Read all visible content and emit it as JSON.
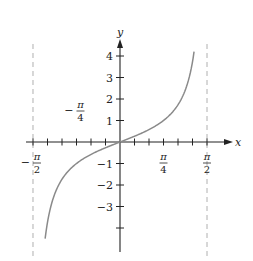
{
  "chart_data": {
    "type": "line",
    "title": "",
    "function": "y = tan(x)",
    "xlabel": "x",
    "ylabel": "y",
    "xlim": [
      -1.5708,
      1.5708
    ],
    "ylim": [
      -5,
      4.5
    ],
    "x_ticks": {
      "step": 0.2618,
      "labels": [
        {
          "value": -1.5708,
          "text": "−π/2",
          "num": "π",
          "den": "2",
          "sign": "−"
        },
        {
          "value": -0.7854,
          "text": "−π/4",
          "num": "π",
          "den": "4",
          "sign": "−"
        },
        {
          "value": 0.7854,
          "text": "π/4",
          "num": "π",
          "den": "4",
          "sign": ""
        },
        {
          "value": 1.5708,
          "text": "π/2",
          "num": "π",
          "den": "2",
          "sign": ""
        }
      ]
    },
    "y_ticks": {
      "values": [
        -4,
        -3,
        -2,
        -1,
        1,
        2,
        3,
        4
      ],
      "labels": [
        {
          "value": 4,
          "text": "4"
        },
        {
          "value": 3,
          "text": "3"
        },
        {
          "value": 2,
          "text": "2"
        },
        {
          "value": 1,
          "text": "1"
        },
        {
          "value": -1,
          "text": "−1"
        },
        {
          "value": -2,
          "text": "−2"
        },
        {
          "value": -3,
          "text": "−3"
        }
      ]
    },
    "asymptotes": [
      {
        "x": -1.5708,
        "style": "dashed"
      },
      {
        "x": 1.5708,
        "style": "dashed"
      }
    ],
    "series": [
      {
        "name": "tan(x)",
        "x_range": [
          -1.352,
          1.337
        ],
        "x": [
          -1.352,
          -1.3,
          -1.2,
          -1.1,
          -1.0,
          -0.8,
          -0.6,
          -0.4,
          -0.2,
          0,
          0.2,
          0.4,
          0.6,
          0.8,
          1.0,
          1.1,
          1.2,
          1.3,
          1.337
        ],
        "values": [
          -4.5,
          -3.6,
          -2.57,
          -1.96,
          -1.56,
          -1.03,
          -0.68,
          -0.42,
          -0.2,
          0,
          0.2,
          0.42,
          0.68,
          1.03,
          1.56,
          1.96,
          2.57,
          3.6,
          4.2
        ],
        "color": "#888888"
      }
    ],
    "grid": false,
    "legend": null
  },
  "style": {
    "axis_color": "#222222",
    "curve_color": "#8a8a8a",
    "asymptote_color": "#b0b0b0"
  }
}
